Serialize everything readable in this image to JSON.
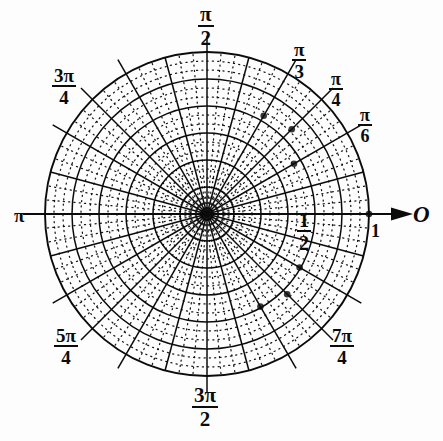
{
  "figure": {
    "background_color": "#fdfdfd",
    "ink_color": "#0b0b0b",
    "center": {
      "x": 207,
      "y": 214
    },
    "outer_radius": 162
  },
  "axis_labels": {
    "origin_letter": "O",
    "unit_tick": "1",
    "half_tick_numerator": "1",
    "half_tick_denominator": "2",
    "pi_label": "π"
  },
  "angle_labels": [
    {
      "id": "pi-over-6",
      "numerator": "π",
      "denominator": "6",
      "angle_deg": 30,
      "text": "π/6"
    },
    {
      "id": "pi-over-4",
      "numerator": "π",
      "denominator": "4",
      "angle_deg": 45,
      "text": "π/4"
    },
    {
      "id": "pi-over-3",
      "numerator": "π",
      "denominator": "3",
      "angle_deg": 60,
      "text": "π/3"
    },
    {
      "id": "pi-over-2",
      "numerator": "π",
      "denominator": "2",
      "angle_deg": 90,
      "text": "π/2"
    },
    {
      "id": "three-pi-over-4",
      "numerator": "3π",
      "denominator": "4",
      "angle_deg": 135,
      "text": "3π/4"
    },
    {
      "id": "pi",
      "numerator": "π",
      "denominator": "",
      "angle_deg": 180,
      "text": "π"
    },
    {
      "id": "five-pi-over-4",
      "numerator": "5π",
      "denominator": "4",
      "angle_deg": 225,
      "text": "5π/4"
    },
    {
      "id": "three-pi-over-2",
      "numerator": "3π",
      "denominator": "2",
      "angle_deg": 270,
      "text": "3π/2"
    },
    {
      "id": "seven-pi-over-4",
      "numerator": "7π",
      "denominator": "4",
      "angle_deg": 315,
      "text": "7π/4"
    }
  ],
  "chart_data": {
    "type": "polar-grid",
    "radial_axis": {
      "label": "r",
      "range": [
        0,
        1
      ],
      "major_ticks": [
        0.5,
        1
      ],
      "major_tick_labels": [
        "1/2",
        "1"
      ],
      "major_circle_radii_fraction": [
        0.1667,
        0.3333,
        0.5,
        0.6667,
        0.8333,
        1
      ],
      "minor_circle_count_between_majors": 2,
      "minor_circles_dotted": true
    },
    "angular_axis": {
      "label": "θ",
      "range_deg": [
        0,
        360
      ],
      "major_spoke_step_deg": 15,
      "major_spoke_count": 24,
      "minor_spokes_between_majors": 2,
      "minor_spokes_dotted": true,
      "labeled_angles_deg": [
        0,
        30,
        45,
        60,
        90,
        135,
        180,
        225,
        270,
        315
      ],
      "labeled_angle_text": [
        "O",
        "π/6",
        "π/4",
        "π/3",
        "π/2",
        "3π/4",
        "π",
        "5π/4",
        "3π/2",
        "7π/4"
      ]
    },
    "grid": true,
    "legend": null,
    "marked_points": [
      {
        "r": 0.62,
        "theta_deg": 30
      },
      {
        "r": 0.74,
        "theta_deg": 45
      },
      {
        "r": 0.7,
        "theta_deg": 60
      },
      {
        "r": 0.66,
        "theta_deg": 330
      },
      {
        "r": 0.7,
        "theta_deg": 315
      },
      {
        "r": 0.66,
        "theta_deg": 300
      },
      {
        "r": 1.0,
        "theta_deg": 0
      }
    ]
  }
}
